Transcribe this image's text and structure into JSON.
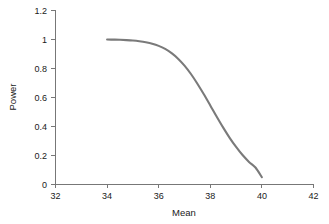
{
  "chart_data": {
    "type": "line",
    "title": "",
    "subtitle": "",
    "xlabel": "Mean",
    "ylabel": "Power",
    "xlim": [
      32,
      42
    ],
    "ylim": [
      0,
      1.2
    ],
    "xticks": [
      32,
      34,
      36,
      38,
      40,
      42
    ],
    "xtick_labels": [
      "32",
      "34",
      "36",
      "38",
      "40",
      "42"
    ],
    "yticks": [
      0,
      0.2,
      0.4,
      0.6,
      0.8,
      1,
      1.2
    ],
    "ytick_labels": [
      "0",
      "0.2",
      "0.4",
      "0.6",
      "0.8",
      "1",
      "1.2"
    ],
    "grid": false,
    "legend": null,
    "series": [
      {
        "name": "Power",
        "color": "#7a7a7a",
        "line_width": 2.1,
        "x": [
          34.0,
          34.25,
          34.5,
          34.75,
          35.0,
          35.25,
          35.5,
          35.75,
          36.0,
          36.25,
          36.5,
          36.75,
          37.0,
          37.25,
          37.5,
          37.75,
          38.0,
          38.25,
          38.5,
          38.75,
          39.0,
          39.25,
          39.5,
          39.75,
          40.0
        ],
        "values": [
          1.0,
          0.999,
          0.998,
          0.996,
          0.993,
          0.988,
          0.981,
          0.971,
          0.956,
          0.935,
          0.906,
          0.868,
          0.82,
          0.762,
          0.695,
          0.622,
          0.545,
          0.467,
          0.392,
          0.322,
          0.259,
          0.203,
          0.156,
          0.117,
          0.05
        ]
      }
    ]
  },
  "axes": {
    "x_title": "Mean",
    "y_title": "Power"
  }
}
